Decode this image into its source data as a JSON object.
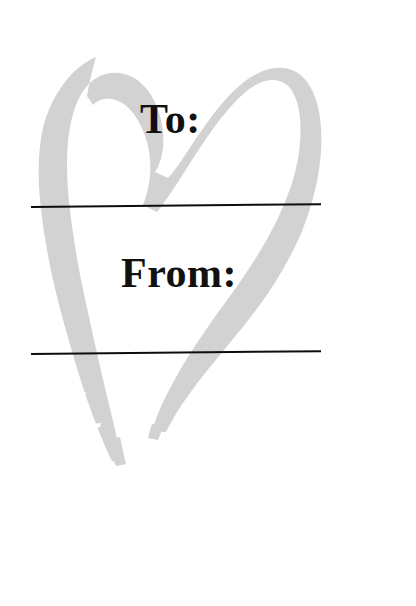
{
  "page": {
    "kind": "gift-tag",
    "background_color": "#ffffff",
    "width": 416,
    "height": 606
  },
  "artwork": {
    "name": "brush-stroke-heart",
    "shape": "heart",
    "style": "hand-painted open brush stroke",
    "fill_color": "#d2d2d2",
    "description": "Large light-gray hand-painted heart outline occupying the upper two thirds of the tag"
  },
  "fields": [
    {
      "id": "to",
      "label": "To:",
      "value": "",
      "line_color": "#0d0d0d"
    },
    {
      "id": "from",
      "label": "From:",
      "value": "",
      "line_color": "#0d0d0d"
    }
  ],
  "rules": {
    "to_line_name": "to-write-line",
    "from_line_name": "from-write-line"
  }
}
